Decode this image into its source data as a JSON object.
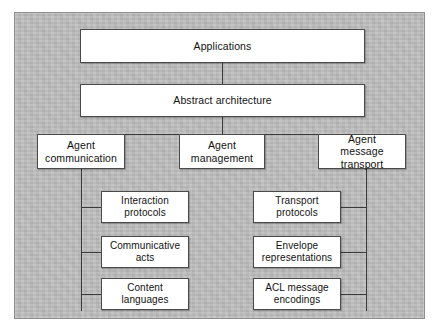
{
  "diagram": {
    "background_color": "#bebebe",
    "box_fill_color": "#ffffff",
    "box_border_color": "#4a4a4a",
    "line_color": "#3a3a3a",
    "levels": {
      "top": {
        "label": "Applications"
      },
      "second": {
        "label": "Abstract architecture"
      },
      "third": [
        {
          "label": "Agent\ncommunication",
          "line1": "Agent",
          "line2": "communication"
        },
        {
          "label": "Agent\nmanagement",
          "line1": "Agent",
          "line2": "management"
        },
        {
          "label": "Agent message\ntransport",
          "line1": "Agent message",
          "line2": "transport"
        }
      ],
      "left_leaves": [
        {
          "line1": "Interaction",
          "line2": "protocols"
        },
        {
          "line1": "Communicative",
          "line2": "acts"
        },
        {
          "line1": "Content",
          "line2": "languages"
        }
      ],
      "right_leaves": [
        {
          "line1": "Transport",
          "line2": "protocols"
        },
        {
          "line1": "Envelope",
          "line2": "representations"
        },
        {
          "line1": "ACL message",
          "line2": "encodings"
        }
      ]
    }
  }
}
